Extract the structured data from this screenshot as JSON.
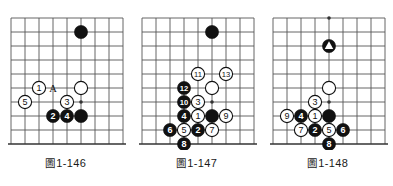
{
  "page": {
    "kind": "go-problem-diagrams",
    "background_color": "#ffffff",
    "line_color": "#555555",
    "edge_line_color": "#333333",
    "black_stone_color": "#111111",
    "white_stone_color": "#ffffff",
    "stone_outline_color": "#111111",
    "label_on_black_color": "#ffffff",
    "label_on_white_color": "#111111"
  },
  "figures": [
    {
      "id": "fig-1-146",
      "caption_mark": "圖",
      "caption_number": "1-146",
      "caption": "圖 1-146",
      "grid": {
        "cols": 8,
        "rows": 9,
        "spacing": 14
      },
      "star_points": [
        {
          "col": 5,
          "row": 6
        }
      ],
      "bottom_edge_row": 8,
      "stones": [
        {
          "color": "black",
          "col": 5,
          "row": 1,
          "label": ""
        },
        {
          "color": "white",
          "col": 5,
          "row": 5,
          "label": ""
        },
        {
          "color": "black",
          "col": 5,
          "row": 7,
          "label": ""
        },
        {
          "color": "white",
          "col": 2,
          "row": 5,
          "label": "1"
        },
        {
          "color": "black",
          "col": 3,
          "row": 7,
          "label": "2"
        },
        {
          "color": "white",
          "col": 4,
          "row": 6,
          "label": "3"
        },
        {
          "color": "black",
          "col": 4,
          "row": 7,
          "label": "4"
        },
        {
          "color": "white",
          "col": 1,
          "row": 6,
          "label": "5"
        }
      ],
      "point_markers": [
        {
          "text": "A",
          "col": 3,
          "row": 5
        }
      ]
    },
    {
      "id": "fig-1-147",
      "caption_mark": "圖",
      "caption_number": "1-147",
      "caption": "圖 1-147",
      "grid": {
        "cols": 8,
        "rows": 9,
        "spacing": 14
      },
      "star_points": [
        {
          "col": 5,
          "row": 6
        }
      ],
      "bottom_edge_row": 8,
      "stones": [
        {
          "color": "black",
          "col": 5,
          "row": 1,
          "label": ""
        },
        {
          "color": "white",
          "col": 5,
          "row": 5,
          "label": ""
        },
        {
          "color": "black",
          "col": 5,
          "row": 7,
          "label": ""
        },
        {
          "color": "white",
          "col": 4,
          "row": 7,
          "label": "1"
        },
        {
          "color": "black",
          "col": 4,
          "row": 8,
          "label": "2"
        },
        {
          "color": "white",
          "col": 4,
          "row": 6,
          "label": "3"
        },
        {
          "color": "black",
          "col": 3,
          "row": 7,
          "label": "4"
        },
        {
          "color": "white",
          "col": 3,
          "row": 8,
          "label": "5"
        },
        {
          "color": "black",
          "col": 2,
          "row": 8,
          "label": "6"
        },
        {
          "color": "white",
          "col": 5,
          "row": 8,
          "label": "7"
        },
        {
          "color": "black",
          "col": 3,
          "row": 9,
          "label": "8"
        },
        {
          "color": "white",
          "col": 6,
          "row": 7,
          "label": "9"
        },
        {
          "color": "black",
          "col": 3,
          "row": 6,
          "label": "10"
        },
        {
          "color": "white",
          "col": 4,
          "row": 4,
          "label": "11"
        },
        {
          "color": "black",
          "col": 3,
          "row": 5,
          "label": "12"
        },
        {
          "color": "white",
          "col": 6,
          "row": 4,
          "label": "13"
        }
      ],
      "point_markers": []
    },
    {
      "id": "fig-1-148",
      "caption_mark": "圖",
      "caption_number": "1-148",
      "caption": "圖 1-148",
      "grid": {
        "cols": 8,
        "rows": 9,
        "spacing": 14
      },
      "star_points": [
        {
          "col": 4,
          "row": 0
        },
        {
          "col": 4,
          "row": 6
        }
      ],
      "bottom_edge_row": 8,
      "stones": [
        {
          "color": "black",
          "col": 4,
          "row": 2,
          "label": "",
          "marker": "triangle"
        },
        {
          "color": "white",
          "col": 4,
          "row": 5,
          "label": ""
        },
        {
          "color": "black",
          "col": 4,
          "row": 7,
          "label": ""
        },
        {
          "color": "white",
          "col": 3,
          "row": 7,
          "label": "1"
        },
        {
          "color": "black",
          "col": 3,
          "row": 8,
          "label": "2"
        },
        {
          "color": "white",
          "col": 3,
          "row": 6,
          "label": "3"
        },
        {
          "color": "black",
          "col": 2,
          "row": 7,
          "label": "4"
        },
        {
          "color": "white",
          "col": 4,
          "row": 8,
          "label": "5"
        },
        {
          "color": "black",
          "col": 5,
          "row": 8,
          "label": "6"
        },
        {
          "color": "white",
          "col": 2,
          "row": 8,
          "label": "7"
        },
        {
          "color": "black",
          "col": 4,
          "row": 9,
          "label": "8"
        },
        {
          "color": "white",
          "col": 1,
          "row": 7,
          "label": "9"
        }
      ],
      "point_markers": []
    }
  ]
}
